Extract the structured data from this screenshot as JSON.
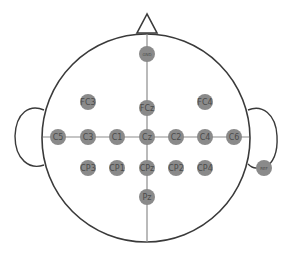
{
  "diagram": {
    "colors": {
      "outline": "#3a3a3a",
      "axis": "#8c8c8c",
      "electrode_fill": "#8a8a8a",
      "electrode_text": "#4a4a4a",
      "background": "#ffffff"
    },
    "head": {
      "cx": 146,
      "cy": 138,
      "r": 104
    },
    "electrodes": [
      {
        "id": "GND",
        "label": "GND",
        "x": 147,
        "y": 54,
        "small": true
      },
      {
        "id": "FC3",
        "label": "FC3",
        "x": 88,
        "y": 102
      },
      {
        "id": "FCz",
        "label": "FCz",
        "x": 147,
        "y": 108
      },
      {
        "id": "FC4",
        "label": "FC4",
        "x": 205,
        "y": 102
      },
      {
        "id": "C5",
        "label": "C5",
        "x": 58,
        "y": 137
      },
      {
        "id": "C3",
        "label": "C3",
        "x": 88,
        "y": 137
      },
      {
        "id": "C1",
        "label": "C1",
        "x": 117,
        "y": 137
      },
      {
        "id": "Cz",
        "label": "Cz",
        "x": 147,
        "y": 137
      },
      {
        "id": "C2",
        "label": "C2",
        "x": 176,
        "y": 137
      },
      {
        "id": "C4",
        "label": "C4",
        "x": 205,
        "y": 137
      },
      {
        "id": "C6",
        "label": "C6",
        "x": 234,
        "y": 137
      },
      {
        "id": "CP3",
        "label": "CP3",
        "x": 88,
        "y": 168
      },
      {
        "id": "CP1",
        "label": "CP1",
        "x": 117,
        "y": 168
      },
      {
        "id": "CPz",
        "label": "CPz",
        "x": 147,
        "y": 168
      },
      {
        "id": "CP2",
        "label": "CP2",
        "x": 176,
        "y": 168
      },
      {
        "id": "CP4",
        "label": "CP4",
        "x": 205,
        "y": 168
      },
      {
        "id": "Pz",
        "label": "Pz",
        "x": 147,
        "y": 197
      },
      {
        "id": "REF",
        "label": "REF",
        "x": 264,
        "y": 168,
        "small": true
      }
    ]
  }
}
